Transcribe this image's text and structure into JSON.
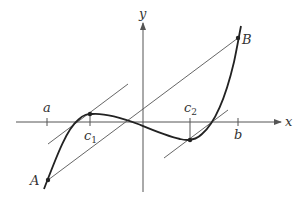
{
  "diagram": {
    "type": "mean-value-theorem-illustration",
    "colors": {
      "background": "#ffffff",
      "axis": "#555555",
      "curve": "#222222",
      "line": "#555555",
      "point": "#222222",
      "label": "#333333"
    },
    "axes": {
      "x_label": "x",
      "y_label": "y"
    },
    "ticks": {
      "a": "a",
      "b": "b",
      "c1_base": "c",
      "c1_sub": "1",
      "c2_base": "c",
      "c2_sub": "2"
    },
    "points": {
      "A": "A",
      "B": "B"
    },
    "lines": [
      {
        "name": "secant-AB",
        "description": "Secant line through A and B"
      },
      {
        "name": "tangent-c1",
        "description": "Tangent at c1 parallel to AB"
      },
      {
        "name": "tangent-c2",
        "description": "Tangent at c2 parallel to AB"
      }
    ]
  }
}
